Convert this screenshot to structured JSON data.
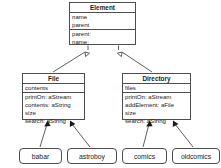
{
  "diagram": {
    "type": "uml-class-diagram",
    "stroke_color": "#4d4d4d",
    "text_color": "#1a1a1a",
    "background_color": "#ffffff"
  },
  "classes": [
    {
      "key": "element",
      "name": "Element",
      "attributes": [
        "name",
        "parent"
      ],
      "methods": [
        "parent:",
        "name:"
      ],
      "box": {
        "x": 69,
        "y": 2,
        "width": 67,
        "height": 43
      }
    },
    {
      "key": "file",
      "name": "File",
      "attributes": [
        "contents"
      ],
      "methods": [
        "printOn: aStream",
        "contents: aString",
        "size",
        "search: aString"
      ],
      "box": {
        "x": 22,
        "y": 73,
        "width": 63,
        "height": 47
      }
    },
    {
      "key": "directory",
      "name": "Directory",
      "attributes": [
        "files"
      ],
      "methods": [
        "printOn: aStream",
        "addElement: aFile",
        "size",
        "search: aString"
      ],
      "box": {
        "x": 122,
        "y": 73,
        "width": 69,
        "height": 47
      }
    }
  ],
  "instances": [
    {
      "key": "babar",
      "label": "babar",
      "box": {
        "x": 19,
        "y": 148,
        "width": 43,
        "height": 16
      }
    },
    {
      "key": "astroboy",
      "label": "astroboy",
      "box": {
        "x": 67,
        "y": 148,
        "width": 50,
        "height": 16
      }
    },
    {
      "key": "comics",
      "label": "comics",
      "box": {
        "x": 122,
        "y": 148,
        "width": 45,
        "height": 16
      }
    },
    {
      "key": "oldcomics",
      "label": "oldcomics",
      "box": {
        "x": 172,
        "y": 148,
        "width": 48,
        "height": 16
      }
    }
  ],
  "relationships": [
    {
      "key": "file-inherits-element",
      "type": "generalization",
      "from": "File",
      "to": "Element",
      "arrowhead": "hollow-triangle"
    },
    {
      "key": "directory-inherits-element",
      "type": "generalization",
      "from": "Directory",
      "to": "Element",
      "arrowhead": "hollow-triangle"
    },
    {
      "key": "babar-instance-of-file",
      "type": "instantiation",
      "from": "babar",
      "to": "File",
      "arrowhead": "solid-arrow"
    },
    {
      "key": "astroboy-instance-of-file",
      "type": "instantiation",
      "from": "astroboy",
      "to": "File",
      "arrowhead": "solid-arrow"
    },
    {
      "key": "comics-instance-of-directory",
      "type": "instantiation",
      "from": "comics",
      "to": "Directory",
      "arrowhead": "solid-arrow"
    },
    {
      "key": "oldcomics-instance-of-directory",
      "type": "instantiation",
      "from": "oldcomics",
      "to": "Directory",
      "arrowhead": "solid-arrow"
    }
  ]
}
